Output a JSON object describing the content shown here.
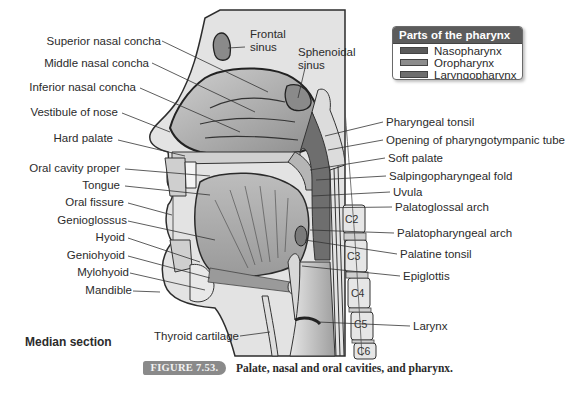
{
  "figure": {
    "number_label": "FIGURE 7.53.",
    "caption": "Palate, nasal and oral cavities, and pharynx.",
    "view_label": "Median section"
  },
  "legend": {
    "title": "Parts of the pharynx",
    "items": [
      {
        "label": "Nasopharynx",
        "color": "#5a5a5a"
      },
      {
        "label": "Oropharynx",
        "color": "#8c8c8c"
      },
      {
        "label": "Laryngopharynx",
        "color": "#6e6e6e"
      }
    ]
  },
  "labels_left": [
    {
      "id": "superior-nasal-concha",
      "text": "Superior nasal concha"
    },
    {
      "id": "middle-nasal-concha",
      "text": "Middle nasal concha"
    },
    {
      "id": "inferior-nasal-concha",
      "text": "Inferior nasal concha"
    },
    {
      "id": "vestibule-of-nose",
      "text": "Vestibule of nose"
    },
    {
      "id": "hard-palate",
      "text": "Hard palate"
    },
    {
      "id": "oral-cavity-proper",
      "text": "Oral cavity proper"
    },
    {
      "id": "tongue",
      "text": "Tongue"
    },
    {
      "id": "oral-fissure",
      "text": "Oral fissure"
    },
    {
      "id": "genioglossus",
      "text": "Genioglossus"
    },
    {
      "id": "hyoid",
      "text": "Hyoid"
    },
    {
      "id": "geniohyoid",
      "text": "Geniohyoid"
    },
    {
      "id": "mylohyoid",
      "text": "Mylohyoid"
    },
    {
      "id": "mandible",
      "text": "Mandible"
    }
  ],
  "labels_top": [
    {
      "id": "frontal-sinus",
      "line1": "Frontal",
      "line2": "sinus"
    },
    {
      "id": "sphenoidal-sinus",
      "line1": "Sphenoidal",
      "line2": "sinus"
    }
  ],
  "labels_right": [
    {
      "id": "pharyngeal-tonsil",
      "text": "Pharyngeal tonsil"
    },
    {
      "id": "opening-of-pharyngotympanic-tube",
      "text": "Opening of pharyngotympanic tube"
    },
    {
      "id": "soft-palate",
      "text": "Soft palate"
    },
    {
      "id": "salpingopharyngeal-fold",
      "text": "Salpingopharyngeal fold"
    },
    {
      "id": "uvula",
      "text": "Uvula"
    },
    {
      "id": "palatoglossal-arch",
      "text": "Palatoglossal arch"
    },
    {
      "id": "palatopharyngeal-arch",
      "text": "Palatopharyngeal arch"
    },
    {
      "id": "palatine-tonsil",
      "text": "Palatine tonsil"
    },
    {
      "id": "epiglottis",
      "text": "Epiglottis"
    },
    {
      "id": "larynx",
      "text": "Larynx"
    }
  ],
  "labels_bottom": [
    {
      "id": "thyroid-cartilage",
      "text": "Thyroid cartilage"
    }
  ],
  "vertebrae": [
    "C2",
    "C3",
    "C4",
    "C5",
    "C6"
  ]
}
